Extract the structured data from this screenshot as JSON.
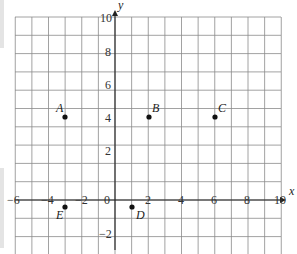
{
  "diagram": {
    "type": "coordinate-grid",
    "x_axis": {
      "label": "x",
      "min": -6,
      "max": 10,
      "tick_labels": [
        "-6",
        "-4",
        "-2",
        "0",
        "2",
        "4",
        "6",
        "8",
        "10"
      ]
    },
    "y_axis": {
      "label": "y",
      "min": -3,
      "max": 10,
      "tick_labels": [
        "10",
        "8",
        "6",
        "4",
        "2",
        "-2"
      ]
    },
    "origin_label": "0",
    "points": [
      {
        "name": "A",
        "x": -3,
        "y": 5
      },
      {
        "name": "B",
        "x": 2,
        "y": 5
      },
      {
        "name": "C",
        "x": 6,
        "y": 5
      },
      {
        "name": "D",
        "x": 1,
        "y": -1
      },
      {
        "name": "E",
        "x": -3,
        "y": -1
      }
    ]
  }
}
